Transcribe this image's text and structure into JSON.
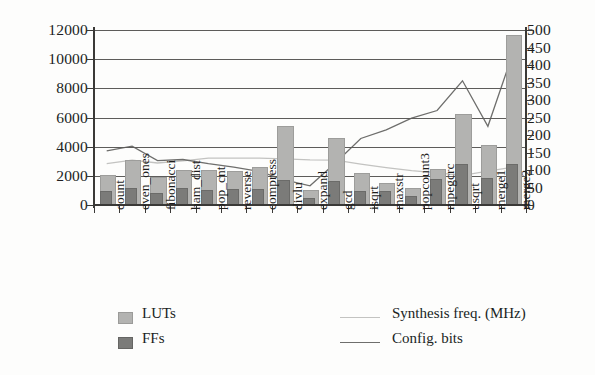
{
  "chart_data": {
    "type": "bar",
    "title": "",
    "xlabel": "",
    "ylabel": "",
    "y2label": "",
    "grid": true,
    "legend_position": "bottom",
    "ylim": [
      0,
      12000
    ],
    "y2lim": [
      0,
      500
    ],
    "yticks": [
      "0",
      "2000",
      "4000",
      "6000",
      "8000",
      "10000",
      "12000"
    ],
    "y2ticks": [
      "0",
      "50",
      "100",
      "150",
      "200",
      "250",
      "300",
      "350",
      "400",
      "450",
      "500"
    ],
    "categories": [
      "count",
      "even_ones",
      "fibonacci",
      "ham_dist",
      "pop_cnt",
      "reverse",
      "compress",
      "divlu",
      "expand",
      "gcd",
      "isqrt",
      "maxstr",
      "popcount3",
      "mpegcrc",
      "usqrt",
      "merge1",
      "merge2"
    ],
    "series": [
      {
        "name": "LUTs",
        "axis": "left",
        "kind": "bar",
        "color": "#b3b3b1",
        "values": [
          1900,
          2950,
          1750,
          2250,
          2250,
          2200,
          2450,
          5300,
          900,
          4450,
          2050,
          1400,
          1050,
          2300,
          6100,
          3950,
          11500
        ]
      },
      {
        "name": "FFs",
        "axis": "left",
        "kind": "bar",
        "color": "#7b7b79",
        "values": [
          820,
          1050,
          700,
          1000,
          900,
          950,
          950,
          1550,
          350,
          1500,
          800,
          850,
          500,
          1650,
          2650,
          1700,
          2700
        ]
      },
      {
        "name": "Synthesis freq. (MHz)",
        "axis": "right",
        "kind": "line",
        "color": "#c3c3c1",
        "values": [
          118,
          128,
          120,
          126,
          134,
          134,
          134,
          132,
          129,
          128,
          117,
          107,
          98,
          92,
          85,
          97,
          108
        ]
      },
      {
        "name": "Config. bits",
        "axis": "right",
        "kind": "line",
        "color": "#6e6e6c",
        "values": [
          155,
          168,
          127,
          130,
          118,
          108,
          96,
          72,
          55,
          120,
          190,
          215,
          248,
          270,
          355,
          225,
          437
        ]
      }
    ],
    "legend_entries": [
      "LUTs",
      "FFs",
      "Synthesis freq. (MHz)",
      "Config. bits"
    ]
  },
  "legend": {
    "lut_label": "LUTs",
    "ff_label": "FFs",
    "freq_label": "Synthesis freq. (MHz)",
    "cfg_label": "Config. bits"
  }
}
